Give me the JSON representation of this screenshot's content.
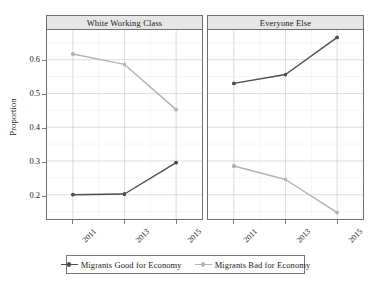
{
  "chart_data": {
    "type": "line",
    "title": "",
    "subtitle": "",
    "xlabel": "",
    "ylabel": "Proportion",
    "x": [
      "2011",
      "2013",
      "2015"
    ],
    "categories": [
      "2011",
      "2013",
      "2015"
    ],
    "ylim": [
      0.128,
      0.688
    ],
    "yticks": [
      0.2,
      0.3,
      0.4,
      0.5,
      0.6
    ],
    "ytick_labels": [
      "0.2",
      "0.3",
      "0.4",
      "0.5",
      "0.6"
    ],
    "minor_yticks": [
      0.15,
      0.25,
      0.35,
      0.45,
      0.55,
      0.65
    ],
    "grid": true,
    "legend_position": "bottom",
    "facets": [
      {
        "label": "White Working Class",
        "series": [
          {
            "name": "Migrants Good for Economy",
            "color": "#4d4d4d",
            "values": [
              0.2,
              0.202,
              0.295
            ]
          },
          {
            "name": "Migrants Bad for Economy",
            "color": "#b3b3b3",
            "values": [
              0.617,
              0.586,
              0.452
            ]
          }
        ]
      },
      {
        "label": "Everyone Else",
        "series": [
          {
            "name": "Migrants Good for Economy",
            "color": "#4d4d4d",
            "values": [
              0.53,
              0.556,
              0.666
            ]
          },
          {
            "name": "Migrants Bad for Economy",
            "color": "#b3b3b3",
            "values": [
              0.285,
              0.245,
              0.147
            ]
          }
        ]
      }
    ],
    "legend": [
      {
        "label": "Migrants Good for Economy",
        "color": "#4d4d4d"
      },
      {
        "label": "Migrants Bad for Economy",
        "color": "#b3b3b3"
      }
    ]
  },
  "axis": {
    "y_title": "Proportion"
  },
  "style": {
    "strip_background": "#e6e6e6",
    "panel_border": "#6f6f6f",
    "major_grid": "#cfcfcf",
    "minor_grid": "#ebebeb",
    "tick_color": "#7a7a7a",
    "text_color": "#1a1a1a"
  }
}
